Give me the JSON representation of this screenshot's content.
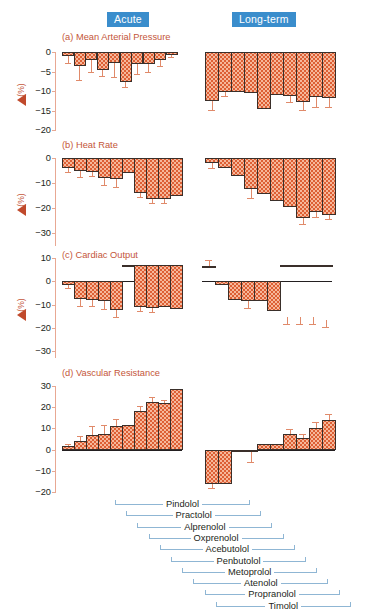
{
  "header": {
    "acute_label": "Acute",
    "longterm_label": "Long-term",
    "badge_color": "#3a8dcc"
  },
  "axis_label": {
    "delta_icon": "delta-triangle-icon",
    "units": "(%)"
  },
  "drugs": [
    "Pindolol",
    "Practolol",
    "Alprenolol",
    "Oxprenolol",
    "Acebutolol",
    "Penbutolol",
    "Metoprolol",
    "Atenolol",
    "Propranolol",
    "Timolol"
  ],
  "chart_data": [
    {
      "type": "bar",
      "panel": "a",
      "title": "(a) Mean Arterial Pressure",
      "ylabel": "(%)",
      "ylim": [
        -20,
        0
      ],
      "yticks": [
        0,
        -5,
        -10,
        -15,
        -20
      ],
      "categories": [
        "Pindolol",
        "Practolol",
        "Alprenolol",
        "Oxprenolol",
        "Acebutolol",
        "Penbutolol",
        "Metoprolol",
        "Atenolol",
        "Propranolol",
        "Timolol"
      ],
      "series": [
        {
          "name": "Acute",
          "values": [
            -1.0,
            -3.5,
            -2.0,
            -4.5,
            -2.8,
            -7.8,
            -3.0,
            -3.0,
            -2.0,
            -0.8
          ],
          "errors": [
            1.8,
            3.8,
            3.2,
            1.6,
            3.6,
            1.2,
            2.6,
            2.2,
            1.6,
            0.6
          ]
        },
        {
          "name": "Long-term",
          "values": [
            -12.6,
            -10.2,
            -10.2,
            -10.6,
            -14.5,
            -11.0,
            -11.3,
            -12.8,
            -11.5,
            -11.8
          ],
          "errors": [
            2.3,
            1.2,
            0.0,
            0.0,
            0.0,
            0.0,
            1.6,
            2.0,
            2.6,
            2.4
          ]
        }
      ]
    },
    {
      "type": "bar",
      "panel": "b",
      "title": "(b) Heat Rate",
      "ylabel": "(%)",
      "ylim": [
        -35,
        0
      ],
      "yticks": [
        0,
        -10,
        -20,
        -30
      ],
      "categories": [
        "Pindolol",
        "Practolol",
        "Alprenolol",
        "Oxprenolol",
        "Acebutolol",
        "Penbutolol",
        "Metoprolol",
        "Atenolol",
        "Propranolol",
        "Timolol"
      ],
      "series": [
        {
          "name": "Acute",
          "values": [
            -3.8,
            -5.2,
            -5.5,
            -8.0,
            -8.2,
            -6.0,
            -13.8,
            -16.5,
            -16.2,
            -15.0
          ],
          "errors": [
            1.8,
            2.2,
            1.6,
            2.6,
            3.4,
            0.0,
            1.6,
            1.4,
            1.6,
            0.0
          ]
        },
        {
          "name": "Long-term",
          "values": [
            -2.0,
            -4.0,
            -7.0,
            -12.5,
            -14.5,
            -17.0,
            -19.5,
            -23.8,
            -21.5,
            -22.8
          ],
          "errors": [
            1.8,
            0.0,
            0.0,
            3.6,
            0.0,
            0.0,
            0.0,
            2.4,
            1.8,
            1.6
          ]
        }
      ]
    },
    {
      "type": "bar",
      "panel": "c",
      "title": "(c) Cardiac Output",
      "ylabel": "(%)",
      "ylim": [
        -33,
        10
      ],
      "yticks": [
        10,
        0,
        -10,
        -20,
        -30
      ],
      "categories": [
        "Pindolol",
        "Practolol",
        "Alprenolol",
        "Oxprenolol",
        "Acebutolol",
        "Penbutolol",
        "Metoprolol",
        "Atenolol",
        "Propranolol",
        "Timolol"
      ],
      "series": [
        {
          "name": "Acute",
          "values": [
            -1.5,
            -7.5,
            -8.0,
            -8.5,
            -12.5,
            7.0,
            -11.0,
            -11.5,
            -11.0,
            -11.8
          ],
          "errors": [
            1.6,
            3.0,
            2.8,
            3.4,
            3.0,
            0.0,
            1.6,
            1.8,
            0.0,
            0.0
          ],
          "bar_tops": [
            0,
            0,
            0,
            0,
            0,
            7,
            7,
            7,
            7,
            7
          ]
        },
        {
          "name": "Long-term",
          "values": [
            6.5,
            -1.5,
            -8.0,
            -8.5,
            -8.5,
            -13.0,
            7.0,
            7.0,
            7.0,
            7.0
          ],
          "errors": [
            2.6,
            0.0,
            0.0,
            3.2,
            0.0,
            0.0,
            0.0,
            0.0,
            0.0,
            0.0
          ],
          "bar_tops": [
            6.5,
            0,
            0,
            0,
            0,
            0,
            7,
            7,
            7,
            7
          ],
          "floating_caps": [
            -18.5,
            -18.5,
            -18.5,
            -19.5
          ]
        }
      ]
    },
    {
      "type": "bar",
      "panel": "d",
      "title": "(d) Vascular Resistance",
      "ylabel": "",
      "ylim": [
        -20,
        30
      ],
      "yticks": [
        30,
        20,
        10,
        0,
        -10,
        -20
      ],
      "categories": [
        "Pindolol",
        "Practolol",
        "Alprenolol",
        "Oxprenolol",
        "Acebutolol",
        "Penbutolol",
        "Metoprolol",
        "Atenolol",
        "Propranolol",
        "Timolol"
      ],
      "series": [
        {
          "name": "Acute",
          "values": [
            1.8,
            4.0,
            6.8,
            7.5,
            11.0,
            11.5,
            18.2,
            22.6,
            21.8,
            28.5
          ],
          "errors": [
            0.8,
            2.6,
            4.2,
            4.0,
            3.6,
            0.0,
            2.6,
            2.0,
            1.6,
            0.0
          ]
        },
        {
          "name": "Long-term",
          "values": [
            -16.2,
            -16.2,
            -1.2,
            -1.0,
            2.6,
            2.6,
            7.5,
            5.5,
            10.2,
            14.0
          ],
          "errors": [
            1.8,
            0.0,
            0.0,
            5.0,
            0.0,
            0.0,
            2.4,
            1.8,
            2.8,
            3.0
          ]
        }
      ]
    }
  ]
}
